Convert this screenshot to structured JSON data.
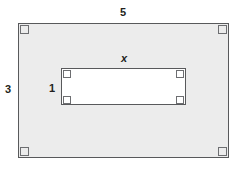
{
  "figure": {
    "kind": "geometry-diagram",
    "colors": {
      "shaded_fill": "#ececec",
      "inner_fill": "#ffffff",
      "stroke": "#58595b",
      "corner_mark_stroke": "#6d6e71",
      "label_text": "#231f20",
      "page_background": "#ffffff"
    },
    "outer_rectangle": {
      "name": "outer-rectangle",
      "width_label": "5",
      "height_label": "3",
      "right_angle_marks": 4
    },
    "inner_rectangle": {
      "name": "inner-rectangle",
      "width_label": "x",
      "height_label": "1",
      "right_angle_marks": 4
    },
    "labels": {
      "top": "5",
      "left": "3",
      "inner_top": "x",
      "inner_left": "1"
    },
    "corner_marks": {
      "outer": [
        "top-left",
        "top-right",
        "bottom-left",
        "bottom-right"
      ],
      "inner": [
        "top-left",
        "top-right",
        "bottom-left",
        "bottom-right"
      ]
    }
  }
}
